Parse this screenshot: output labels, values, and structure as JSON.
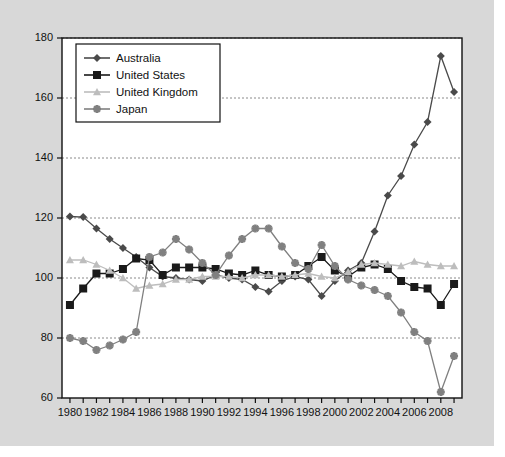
{
  "chart_data": {
    "type": "line",
    "title": "",
    "xlabel": "",
    "ylabel": "",
    "xlim": [
      1979.4,
      2009.6
    ],
    "ylim": [
      60,
      180
    ],
    "yticks": [
      60,
      80,
      100,
      120,
      140,
      160,
      180
    ],
    "ytick_labels": [
      "60",
      "80",
      "100",
      "120",
      "140",
      "160",
      "180"
    ],
    "x": [
      1980,
      1981,
      1982,
      1983,
      1984,
      1985,
      1986,
      1987,
      1988,
      1989,
      1990,
      1991,
      1992,
      1993,
      1994,
      1995,
      1996,
      1997,
      1998,
      1999,
      2000,
      2001,
      2002,
      2003,
      2004,
      2005,
      2006,
      2007,
      2008,
      2009
    ],
    "xtick_labels": [
      "1980",
      "",
      "1982",
      "",
      "1984",
      "",
      "1986",
      "",
      "1988",
      "",
      "1990",
      "",
      "1992",
      "",
      "1994",
      "",
      "1996",
      "",
      "1998",
      "",
      "2000",
      "",
      "2002",
      "",
      "2004",
      "",
      "2006",
      "",
      "2008",
      ""
    ],
    "xticks_minor_every": 1,
    "xticks_label_every": 2,
    "grid": "horizontal-dashed",
    "legend_position": "upper-left-inside",
    "series": [
      {
        "name": "Australia",
        "marker": "diamond",
        "color": "#4a4a4a",
        "values": [
          120.5,
          120.3,
          116.5,
          113.0,
          110.0,
          107.0,
          103.5,
          100.5,
          100.0,
          99.5,
          99.0,
          101.0,
          100.0,
          99.5,
          97.0,
          95.5,
          99.0,
          100.5,
          99.5,
          94.0,
          99.0,
          102.5,
          105.0,
          115.5,
          127.5,
          134.0,
          144.5,
          152.0,
          174.0,
          162.0
        ]
      },
      {
        "name": "United States",
        "marker": "square",
        "color": "#1a1a1a",
        "values": [
          91.0,
          96.5,
          101.5,
          101.5,
          103.0,
          106.5,
          106.0,
          101.0,
          103.5,
          103.5,
          103.5,
          103.0,
          101.5,
          101.0,
          102.5,
          101.0,
          100.5,
          101.0,
          104.0,
          107.0,
          102.5,
          100.5,
          103.5,
          104.5,
          103.0,
          99.0,
          97.0,
          96.5,
          91.0,
          98.0
        ]
      },
      {
        "name": "United Kingdom",
        "marker": "triangle",
        "color": "#bdbdbd",
        "values": [
          106.0,
          106.0,
          104.5,
          102.5,
          100.0,
          96.5,
          97.5,
          98.0,
          99.5,
          99.5,
          100.5,
          100.5,
          100.5,
          100.0,
          101.0,
          101.0,
          100.5,
          101.0,
          101.5,
          100.5,
          100.0,
          102.0,
          104.5,
          105.0,
          104.5,
          104.0,
          105.5,
          104.5,
          104.0,
          104.0
        ]
      },
      {
        "name": "Japan",
        "marker": "star",
        "color": "#808080",
        "values": [
          80.0,
          79.0,
          76.0,
          77.5,
          79.5,
          82.0,
          107.0,
          108.5,
          113.0,
          109.5,
          105.0,
          101.0,
          107.5,
          113.0,
          116.5,
          116.5,
          110.5,
          105.0,
          103.0,
          111.0,
          104.0,
          99.5,
          97.5,
          96.0,
          94.0,
          88.5,
          82.0,
          79.0,
          62.0,
          74.0
        ]
      }
    ]
  }
}
